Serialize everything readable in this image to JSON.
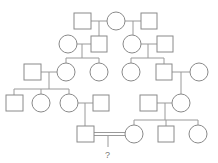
{
  "diagram": {
    "type": "pedigree chart",
    "question_label": "?",
    "legend": {
      "square": "male",
      "circle": "female",
      "double_line": "consanguineous mating"
    }
  }
}
